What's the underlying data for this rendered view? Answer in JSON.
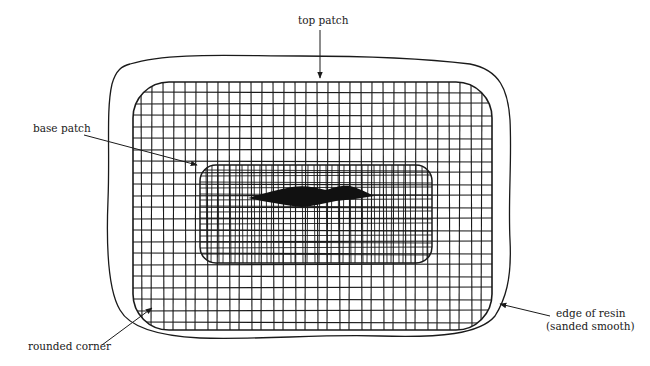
{
  "diagram": {
    "type": "patch-repair-illustration",
    "labels": {
      "top_patch": "top patch",
      "base_patch": "base patch",
      "rounded_corner": "rounded corner",
      "edge_of_resin_line1": "edge of resin",
      "edge_of_resin_line2": "(sanded smooth)"
    },
    "colors": {
      "ink": "#1a1a1a",
      "background": "#ffffff"
    }
  }
}
